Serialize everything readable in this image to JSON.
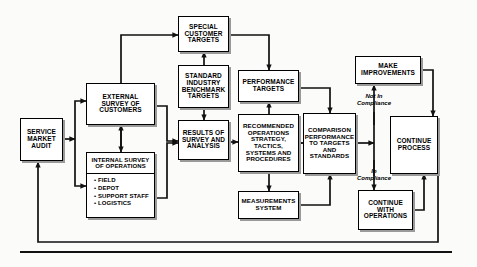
{
  "diagram": {
    "nodes": {
      "service_market_audit": {
        "lines": [
          "SERVICE",
          "MARKET",
          "AUDIT"
        ]
      },
      "external_survey": {
        "lines": [
          "EXTERNAL",
          "SURVEY OF",
          "CUSTOMERS"
        ]
      },
      "internal_survey": {
        "header": [
          "INTERNAL SURVEY",
          "OF OPERATIONS"
        ],
        "items": [
          "• FIELD",
          "• DEPOT",
          "• SUPPORT STAFF",
          "• LOGISTICS"
        ]
      },
      "special_customer_targets": {
        "lines": [
          "SPECIAL",
          "CUSTOMER",
          "TARGETS"
        ]
      },
      "standard_industry_benchmark": {
        "lines": [
          "STANDARD",
          "INDUSTRY",
          "BENCHMARK",
          "TARGETS"
        ]
      },
      "results_of_survey": {
        "lines": [
          "RESULTS OF",
          "SURVEY AND",
          "ANALYSIS"
        ]
      },
      "performance_targets": {
        "lines": [
          "PERFORMANCE",
          "TARGETS"
        ]
      },
      "recommended_operations": {
        "lines": [
          "RECOMMENDED",
          "OPERATIONS",
          "STRATEGY,",
          "TACTICS,",
          "SYSTEMS AND",
          "PROCEDURES"
        ]
      },
      "measurements_system": {
        "lines": [
          "MEASUREMENTS",
          "SYSTEM"
        ]
      },
      "comparison_performance": {
        "lines": [
          "COMPARISON",
          "PERFORMANCE",
          "TO TARGETS",
          "AND",
          "STANDARDS"
        ]
      },
      "make_improvements": {
        "lines": [
          "MAKE",
          "IMPROVEMENTS"
        ]
      },
      "continue_process": {
        "lines": [
          "CONTINUE",
          "PROCESS"
        ]
      },
      "continue_with_operations": {
        "lines": [
          "CONTINUE",
          "WITH",
          "OPERATIONS"
        ]
      }
    },
    "connector_labels": {
      "not_in_compliance": [
        "Not In",
        "Compliance"
      ],
      "in_compliance": [
        "In",
        "Compliance"
      ]
    },
    "colors": {
      "box_fill": "#ffffff",
      "box_border": "#000000",
      "box_shadow": "#9a9a9a",
      "line": "#111111",
      "page_background": "#fbfbfa"
    }
  }
}
